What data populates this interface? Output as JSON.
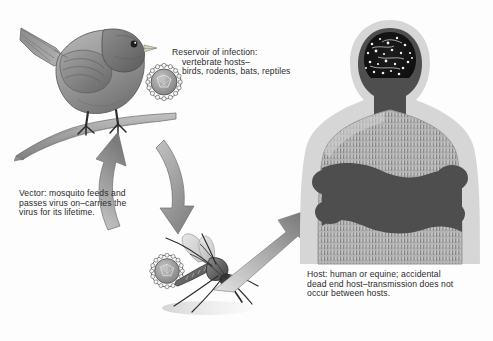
{
  "diagram": {
    "type": "transmission-cycle",
    "background_color": "#fdfdfd",
    "palette": {
      "text": "#2b2b2b",
      "arrow_gray": "#8d8d8d",
      "arrow_gray_dark": "#6f6f6f",
      "body_dark": "#4a4a4a",
      "body_mid": "#8a8a8a",
      "body_light": "#c9c9c9",
      "halo": "#d8d8d8",
      "brain_black": "#141414",
      "bird_gray": "#9a9a9a",
      "bird_dark": "#5e5e5e",
      "branch_gray": "#a8a8a8"
    },
    "captions": {
      "reservoir": "Reservoir of infection:\n    vertebrate hosts–\n    birds, rodents, bats, reptiles",
      "vector": "Vector: mosquito feeds and\npasses virus on–carries the\nvirus for its lifetime.",
      "host": "Host: human or equine; accidental\ndead end host–transmission does not\noccur between hosts."
    },
    "figures": {
      "bird": "bird-perched-on-branch",
      "branch": "tree-branch",
      "mosquito": "mosquito",
      "human": "human-torso-crossed-arms",
      "virion_bird": "virus-particle",
      "virion_mosquito": "virus-particle"
    },
    "arrows": {
      "cycle": "bidirectional-cycle-bird-mosquito",
      "to_host": "mosquito-to-human-transmission"
    }
  }
}
